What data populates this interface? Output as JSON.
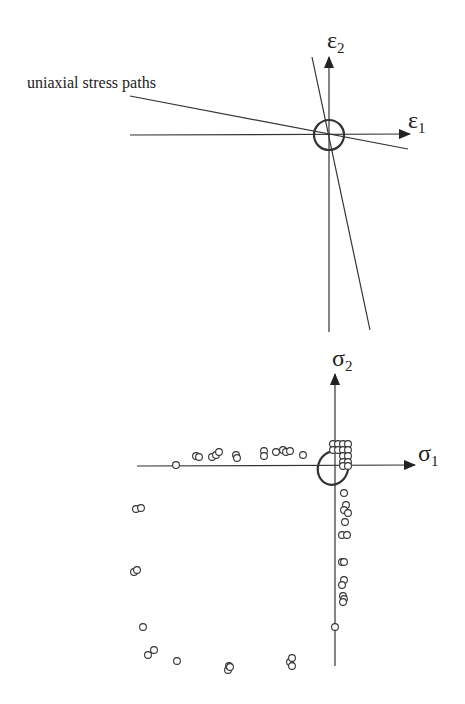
{
  "strain_diagram": {
    "annotation": "uniaxial stress paths",
    "axis_x_label": "ε",
    "axis_x_sub": "1",
    "axis_y_label": "ε",
    "axis_y_sub": "2"
  },
  "stress_diagram": {
    "axis_x_label": "σ",
    "axis_x_sub": "1",
    "axis_y_label": "σ",
    "axis_y_sub": "2",
    "points": [
      [
        176,
        465
      ],
      [
        196,
        456
      ],
      [
        199,
        457
      ],
      [
        212,
        457
      ],
      [
        216,
        455
      ],
      [
        219,
        452
      ],
      [
        236,
        455
      ],
      [
        237,
        458
      ],
      [
        264,
        451
      ],
      [
        264,
        456
      ],
      [
        276,
        452
      ],
      [
        283,
        450
      ],
      [
        286,
        452
      ],
      [
        290,
        451
      ],
      [
        303,
        455
      ],
      [
        333,
        444
      ],
      [
        338,
        444
      ],
      [
        343,
        444
      ],
      [
        348,
        444
      ],
      [
        333,
        450
      ],
      [
        338,
        450
      ],
      [
        343,
        450
      ],
      [
        348,
        450
      ],
      [
        343,
        456
      ],
      [
        348,
        456
      ],
      [
        343,
        462
      ],
      [
        348,
        462
      ],
      [
        343,
        466
      ],
      [
        348,
        466
      ],
      [
        344,
        493
      ],
      [
        346,
        505
      ],
      [
        344,
        510
      ],
      [
        348,
        513
      ],
      [
        345,
        522
      ],
      [
        342,
        535
      ],
      [
        347,
        535
      ],
      [
        342,
        562
      ],
      [
        344,
        562
      ],
      [
        344,
        580
      ],
      [
        342,
        585
      ],
      [
        343,
        596
      ],
      [
        344,
        599
      ],
      [
        343,
        602
      ],
      [
        335,
        627
      ],
      [
        136,
        509
      ],
      [
        141,
        508
      ],
      [
        134,
        572
      ],
      [
        137,
        570
      ],
      [
        143,
        627
      ],
      [
        148,
        655
      ],
      [
        154,
        650
      ],
      [
        177,
        661
      ],
      [
        228,
        670
      ],
      [
        229,
        666
      ],
      [
        230,
        667
      ],
      [
        290,
        662
      ],
      [
        292,
        658
      ],
      [
        292,
        666
      ]
    ]
  },
  "chart_data": {
    "type": "scatter",
    "title": "",
    "panels": [
      {
        "name": "strain space",
        "xlabel": "ε1",
        "ylabel": "ε2",
        "annotation": "uniaxial stress paths",
        "elements": [
          "two straight uniaxial stress path lines crossing origin",
          "small circle at origin"
        ]
      },
      {
        "name": "stress space",
        "xlabel": "σ1",
        "ylabel": "σ2",
        "elements": [
          "small ellipse at origin",
          "open-circle data points along negative σ1 axis, negative σ2 axis and compressive-compressive arc"
        ]
      }
    ]
  }
}
